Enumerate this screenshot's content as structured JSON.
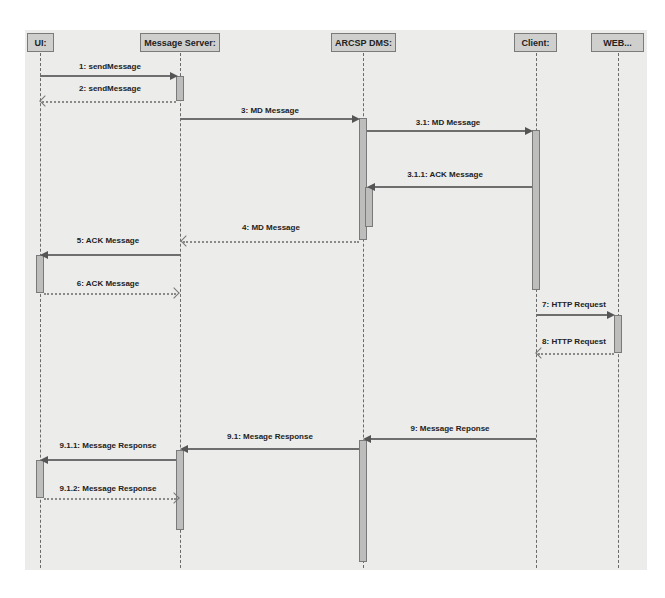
{
  "diagram": {
    "type": "uml-sequence",
    "participants": [
      {
        "id": "ui",
        "label": "UI:"
      },
      {
        "id": "message_server",
        "label": "Message Server:"
      },
      {
        "id": "arcsp_dms",
        "label": "ARCSP DMS:"
      },
      {
        "id": "client",
        "label": "Client:"
      },
      {
        "id": "web",
        "label": "WEB..."
      }
    ],
    "messages": [
      {
        "label": "1: sendMessage",
        "from": "ui",
        "to": "message_server",
        "style": "solid"
      },
      {
        "label": "2: sendMessage",
        "from": "message_server",
        "to": "ui",
        "style": "dashed"
      },
      {
        "label": "3: MD Message",
        "from": "message_server",
        "to": "arcsp_dms",
        "style": "solid"
      },
      {
        "label": "3.1: MD Message",
        "from": "arcsp_dms",
        "to": "client",
        "style": "solid"
      },
      {
        "label": "3.1.1: ACK Message",
        "from": "client",
        "to": "arcsp_dms",
        "style": "solid"
      },
      {
        "label": "4: MD Message",
        "from": "arcsp_dms",
        "to": "message_server",
        "style": "dashed"
      },
      {
        "label": "5: ACK Message",
        "from": "message_server",
        "to": "ui",
        "style": "solid"
      },
      {
        "label": "6: ACK Message",
        "from": "ui",
        "to": "message_server",
        "style": "dashed"
      },
      {
        "label": "7: HTTP Request",
        "from": "client",
        "to": "web",
        "style": "solid"
      },
      {
        "label": "8: HTTP Request",
        "from": "web",
        "to": "client",
        "style": "dashed"
      },
      {
        "label": "9: Message Reponse",
        "from": "client",
        "to": "arcsp_dms",
        "style": "solid"
      },
      {
        "label": "9.1: Mesage Response",
        "from": "arcsp_dms",
        "to": "message_server",
        "style": "solid"
      },
      {
        "label": "9.1.1: Message Response",
        "from": "message_server",
        "to": "ui",
        "style": "solid"
      },
      {
        "label": "9.1.2: Message Response",
        "from": "ui",
        "to": "message_server",
        "style": "dashed"
      }
    ]
  }
}
